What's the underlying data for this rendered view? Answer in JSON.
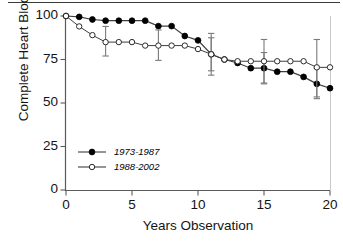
{
  "figure": {
    "background": "#ffffff",
    "axis_color": "#5a5a5a",
    "marker_fill_color": "#000000",
    "marker_open_color": "#ffffff",
    "line_color": "#3f3f3f"
  },
  "chart_data": {
    "type": "line",
    "title": "",
    "xlabel": "Years Observation",
    "ylabel": "Complete Heart Block",
    "xlim": [
      0,
      20
    ],
    "ylim": [
      0,
      100
    ],
    "xticks": [
      0,
      5,
      10,
      15,
      20
    ],
    "xticklabels": [
      "0",
      "5",
      "10",
      "15",
      "20"
    ],
    "yticks": [
      0,
      25,
      50,
      75,
      100
    ],
    "yticklabels": [
      "0",
      "25",
      "50",
      "75",
      "100"
    ],
    "grid": false,
    "legend_position": "lower left",
    "series": [
      {
        "name": "1973-1987",
        "marker": "filled-circle",
        "x": [
          0,
          1,
          2,
          3,
          4,
          5,
          6,
          7,
          8,
          9,
          10,
          11,
          12,
          13,
          14,
          15,
          16,
          17,
          18,
          19,
          20
        ],
        "values": [
          100,
          99.5,
          98,
          97.3,
          97.3,
          97.3,
          97.3,
          94.2,
          94.2,
          88.5,
          86,
          78,
          75,
          73,
          70,
          70,
          68,
          68,
          65,
          61,
          58.5
        ],
        "errorbars": [
          {
            "x": 11,
            "y": 78,
            "low": 66,
            "high": 90
          },
          {
            "x": 15,
            "y": 70,
            "low": 61,
            "high": 79
          },
          {
            "x": 19,
            "y": 61,
            "low": 52.5,
            "high": 70
          }
        ]
      },
      {
        "name": "1988-2002",
        "marker": "open-circle",
        "x": [
          0,
          1,
          2,
          3,
          4,
          5,
          6,
          7,
          8,
          9,
          10,
          11,
          12,
          13,
          14,
          15,
          16,
          17,
          18,
          19,
          20
        ],
        "values": [
          100,
          94,
          89,
          85,
          85,
          85,
          83,
          83,
          83,
          83,
          81,
          78,
          75,
          74,
          74,
          74,
          74,
          74,
          74,
          70.5,
          70.5
        ],
        "errorbars": [
          {
            "x": 3,
            "y": 85,
            "low": 77,
            "high": 94
          },
          {
            "x": 7,
            "y": 83,
            "low": 74.5,
            "high": 92
          },
          {
            "x": 11,
            "y": 78,
            "low": 68.5,
            "high": 87.5
          },
          {
            "x": 15,
            "y": 74,
            "low": 61.5,
            "high": 86.5
          },
          {
            "x": 19,
            "y": 70.5,
            "low": 53.5,
            "high": 86.5
          }
        ]
      }
    ]
  },
  "legend": {
    "entries": [
      {
        "label": "1973-1987",
        "marker": "filled-circle"
      },
      {
        "label": "1988-2002",
        "marker": "open-circle"
      }
    ]
  }
}
